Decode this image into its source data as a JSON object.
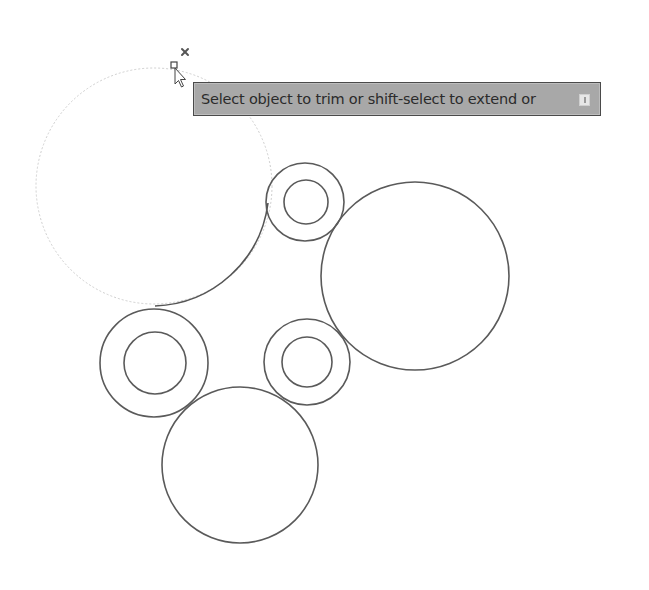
{
  "canvas": {
    "background": "#ffffff",
    "stroke_color": "#555555",
    "highlight_color": "#c8c8c8"
  },
  "tooltip": {
    "prompt_text": "Select object to trim or shift-select to extend or",
    "options_icon": "dropdown-options-icon"
  },
  "cursor": {
    "type": "pickbox-arrow-cursor",
    "badge": "x-mark",
    "x": 174,
    "y": 66
  },
  "drawing": {
    "highlighted_circle": {
      "cx": 154,
      "cy": 186,
      "r": 118
    },
    "trim_arc": {
      "from": [
        267,
        203
      ],
      "to": [
        155,
        307
      ]
    },
    "circles": [
      {
        "name": "top-ring-outer",
        "cx": 305,
        "cy": 202,
        "r": 39
      },
      {
        "name": "top-ring-inner",
        "cx": 306,
        "cy": 202,
        "r": 22
      },
      {
        "name": "right-large",
        "cx": 415,
        "cy": 276,
        "r": 94
      },
      {
        "name": "left-ring-outer",
        "cx": 154,
        "cy": 363,
        "r": 54
      },
      {
        "name": "left-ring-inner",
        "cx": 155,
        "cy": 363,
        "r": 31
      },
      {
        "name": "mid-ring-outer",
        "cx": 307,
        "cy": 362,
        "r": 43
      },
      {
        "name": "mid-ring-inner",
        "cx": 307,
        "cy": 362,
        "r": 25
      },
      {
        "name": "bottom-large",
        "cx": 240,
        "cy": 465,
        "r": 78
      }
    ]
  }
}
